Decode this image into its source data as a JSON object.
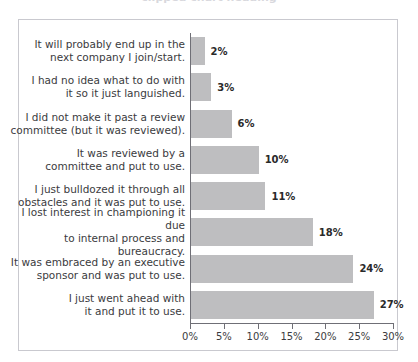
{
  "chart_data": {
    "type": "bar",
    "orientation": "horizontal",
    "title": "",
    "xlabel": "",
    "ylabel": "",
    "xlim": [
      0,
      30
    ],
    "grid": false,
    "legend": null,
    "bar_color": "#bebec0",
    "axis_color": "#6f6f76",
    "frame_color": "#c9c9cf",
    "value_suffix": "%",
    "xticks": [
      0,
      5,
      10,
      15,
      20,
      25,
      30
    ],
    "xtick_labels": [
      "0%",
      "5%",
      "10%",
      "15%",
      "20%",
      "25%",
      "30%"
    ],
    "categories": [
      "It will probably end up in the\nnext company I join/start.",
      "I had no idea what to do with\nit so it just languished.",
      "I did not make it past a review\ncommittee (but it was reviewed).",
      "It was reviewed by a\ncommittee and put to use.",
      "I just bulldozed it through all\nobstacles and it was put to use.",
      "I lost interest in championing it due\nto internal process and bureaucracy.",
      "It was embraced by an executive\nsponsor and was put to use.",
      "I just went ahead with\nit and put it to use."
    ],
    "values": [
      2,
      3,
      6,
      10,
      11,
      18,
      24,
      27
    ],
    "value_labels": [
      "2%",
      "3%",
      "6%",
      "10%",
      "11%",
      "18%",
      "24%",
      "27%"
    ]
  },
  "title_sliver": {
    "text": "clipped chart heading"
  }
}
